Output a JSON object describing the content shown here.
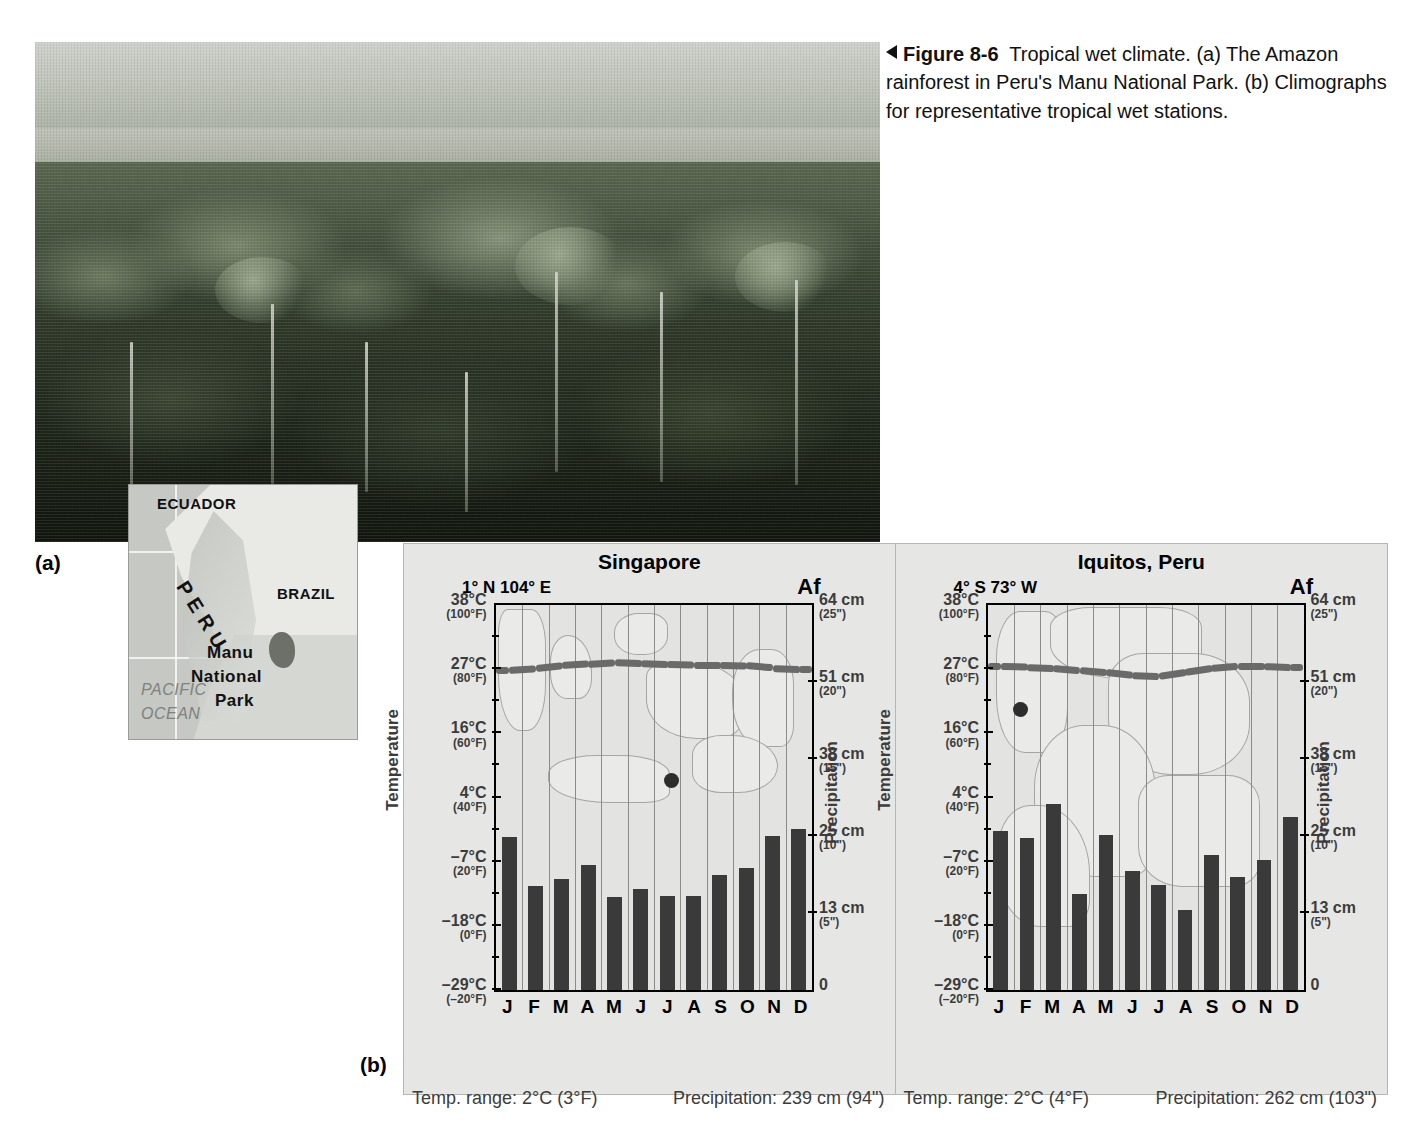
{
  "figure": {
    "label_a": "(a)",
    "label_b": "(b)",
    "caption_number": "Figure 8-6",
    "caption_text": "Tropical wet climate. (a) The Amazon rainforest in Peru's Manu National Park. (b) Climographs for representative tropical wet stations."
  },
  "inset_map": {
    "labels": {
      "ecuador": "ECUADOR",
      "brazil": "BRAZIL",
      "peru": "P E R U",
      "park_line1": "Manu",
      "park_line2": "National",
      "park_line3": "Park",
      "ocean_line1": "PACIFIC",
      "ocean_line2": "OCEAN"
    }
  },
  "axes": {
    "temperature_title": "Temperature",
    "precipitation_title": "Precipitation",
    "temperature_ticks": [
      {
        "c": "38°C",
        "f": "(100°F)"
      },
      {
        "c": "27°C",
        "f": "(80°F)"
      },
      {
        "c": "16°C",
        "f": "(60°F)"
      },
      {
        "c": "4°C",
        "f": "(40°F)"
      },
      {
        "c": "–7°C",
        "f": "(20°F)"
      },
      {
        "c": "–18°C",
        "f": "(0°F)"
      },
      {
        "c": "–29°C",
        "f": "(–20°F)"
      }
    ],
    "precipitation_ticks": [
      {
        "cm": "64 cm",
        "in": "(25\")"
      },
      {
        "cm": "51 cm",
        "in": "(20\")"
      },
      {
        "cm": "38 cm",
        "in": "(15\")"
      },
      {
        "cm": "25 cm",
        "in": "(10\")"
      },
      {
        "cm": "13 cm",
        "in": "(5\")"
      },
      {
        "cm": "0",
        "in": ""
      }
    ],
    "months": [
      "J",
      "F",
      "M",
      "A",
      "M",
      "J",
      "J",
      "A",
      "S",
      "O",
      "N",
      "D"
    ]
  },
  "chart_data": [
    {
      "type": "bar",
      "title": "Singapore",
      "subtitle": "1° N  104° E",
      "climate_code": "Af",
      "xlabel": "",
      "ylabel": "Precipitation",
      "y2label": "Temperature",
      "categories": [
        "J",
        "F",
        "M",
        "A",
        "M",
        "J",
        "J",
        "A",
        "S",
        "O",
        "N",
        "D"
      ],
      "precip_cm": [
        25.4,
        17.3,
        18.5,
        20.8,
        15.5,
        16.8,
        15.7,
        15.7,
        19.2,
        20.3,
        25.6,
        26.8
      ],
      "temp_c": [
        26.6,
        26.9,
        27.4,
        27.7,
        28.0,
        27.8,
        27.6,
        27.5,
        27.5,
        27.4,
        27.0,
        26.8
      ],
      "precip_ylim": [
        0,
        64
      ],
      "temp_ylim": [
        -29,
        38
      ],
      "grid": true,
      "temp_range": "Temp. range: 2°C (3°F)",
      "precip_total": "Precipitation: 239 cm (94\")"
    },
    {
      "type": "bar",
      "title": "Iquitos, Peru",
      "subtitle": "4° S  73° W",
      "climate_code": "Af",
      "xlabel": "",
      "ylabel": "Precipitation",
      "y2label": "Temperature",
      "categories": [
        "J",
        "F",
        "M",
        "A",
        "M",
        "J",
        "J",
        "A",
        "S",
        "O",
        "N",
        "D"
      ],
      "precip_cm": [
        26.4,
        25.2,
        31.0,
        16.0,
        25.7,
        19.8,
        17.5,
        13.3,
        22.4,
        18.8,
        21.6,
        28.7
      ],
      "temp_c": [
        27.3,
        27.2,
        27.0,
        26.6,
        26.2,
        25.7,
        25.5,
        26.2,
        26.9,
        27.3,
        27.3,
        27.1
      ],
      "precip_ylim": [
        0,
        64
      ],
      "temp_ylim": [
        -29,
        38
      ],
      "grid": true,
      "temp_range": "Temp. range: 2°C (4°F)",
      "precip_total": "Precipitation: 262 cm (103\")"
    }
  ]
}
